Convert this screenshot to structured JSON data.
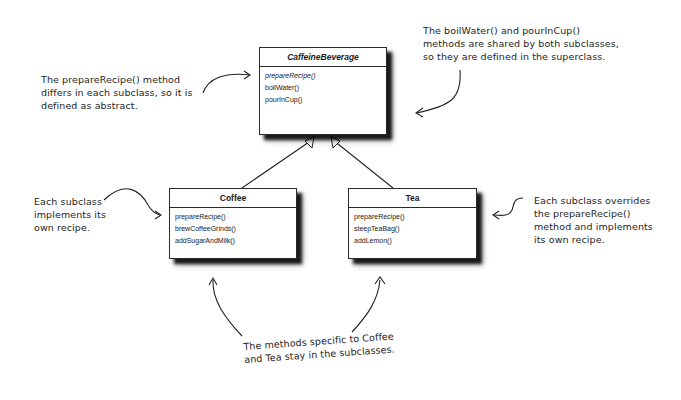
{
  "diagram": {
    "type": "uml-class-diagram",
    "superclass": {
      "name": "CaffeineBeverage",
      "abstract": true,
      "methods": [
        {
          "label": "prepareRecipe()",
          "abstract": true
        },
        {
          "label": "boilWater()",
          "abstract": false
        },
        {
          "label": "pourInCup()",
          "abstract": false
        }
      ]
    },
    "subclasses": [
      {
        "name": "Coffee",
        "methods": [
          {
            "label": "prepareRecipe()"
          },
          {
            "label": "brewCoffeeGrinds()"
          },
          {
            "label": "addSugarAndMilk()"
          }
        ]
      },
      {
        "name": "Tea",
        "methods": [
          {
            "label": "prepareRecipe()"
          },
          {
            "label": "steepTeaBag()"
          },
          {
            "label": "addLemon()"
          }
        ]
      }
    ],
    "relationships": [
      {
        "from": "Coffee",
        "to": "CaffeineBeverage",
        "type": "inheritance"
      },
      {
        "from": "Tea",
        "to": "CaffeineBeverage",
        "type": "inheritance"
      }
    ]
  },
  "annotations": {
    "abstract_note": {
      "lines": [
        "The prepareRecipe() method",
        "differs in each subclass, so it is",
        "defined as abstract."
      ]
    },
    "shared_note": {
      "lines": [
        "The boilWater() and pourInCup()",
        "methods are shared by both subclasses,",
        "so they are defined in the superclass."
      ]
    },
    "coffee_note": {
      "lines": [
        "Each subclass",
        "implements its",
        "own recipe."
      ]
    },
    "tea_note": {
      "lines": [
        "Each subclass overrides",
        "the prepareRecipe()",
        "method and implements",
        "its own recipe."
      ]
    },
    "bottom_note": {
      "lines": [
        "The methods specific to Coffee",
        "and Tea stay in the subclasses."
      ]
    }
  },
  "colors": {
    "background": "#ffffff",
    "ink": "#1e1e1e",
    "border": "#2a2a2a"
  }
}
